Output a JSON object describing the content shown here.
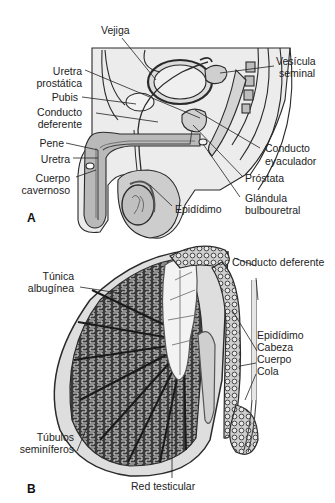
{
  "figure": {
    "panel_a": {
      "letter": "A",
      "labels": {
        "vejiga": "Vejiga",
        "uretra_prostatica_1": "Uretra",
        "uretra_prostatica_2": "prostática",
        "pubis": "Pubis",
        "conducto_deferente_1": "Conducto",
        "conducto_deferente_2": "deferente",
        "pene": "Pene",
        "uretra": "Uretra",
        "cuerpo_cavernoso_1": "Cuerpo",
        "cuerpo_cavernoso_2": "cavernoso",
        "epididimo": "Epidídimo",
        "vesicula_seminal_1": "Vesícula",
        "vesicula_seminal_2": "seminal",
        "conducto_eyaculador_1": "Conducto",
        "conducto_eyaculador_2": "eyaculador",
        "prostata": "Próstata",
        "glandula_bulbouretral_1": "Glándula",
        "glandula_bulbouretral_2": "bulbouretral"
      }
    },
    "panel_b": {
      "letter": "B",
      "labels": {
        "tunica_albuginea_1": "Túnica",
        "tunica_albuginea_2": "albugínea",
        "conducto_deferente": "Conducto deferente",
        "epididimo": "Epidídimo",
        "cabeza": "Cabeza",
        "cuerpo": "Cuerpo",
        "cola": "Cola",
        "tubulos_seminiferos_1": "Túbulos",
        "tubulos_seminiferos_2": "seminíferos",
        "red_testicular": "Red testicular"
      }
    },
    "colors": {
      "tissue_light": "#e6e6e6",
      "tissue_mid": "#c4c4c4",
      "tissue_dark": "#9a9a9a",
      "outline": "#2a2a2a"
    }
  }
}
